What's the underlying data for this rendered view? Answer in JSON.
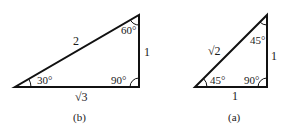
{
  "figures": [
    {
      "id": "b",
      "caption": "(b)",
      "vertices": {
        "left": [
          15,
          87
        ],
        "right": [
          139,
          87
        ],
        "top": [
          139,
          15
        ]
      },
      "angles": {
        "left": "30°",
        "top": "60°",
        "right": "90°"
      },
      "sides": {
        "hypotenuse": "2",
        "vertical": "1",
        "base": "√3"
      }
    },
    {
      "id": "a",
      "caption": "(a)",
      "vertices": {
        "left": [
          195,
          87
        ],
        "right": [
          267,
          87
        ],
        "top": [
          267,
          15
        ]
      },
      "angles": {
        "left": "45°",
        "top": "45°",
        "right": "90°"
      },
      "sides": {
        "hypotenuse": "√2",
        "vertical": "1",
        "base": "1"
      }
    }
  ],
  "colors": {
    "stroke": "#111111",
    "background": "#ffffff"
  }
}
